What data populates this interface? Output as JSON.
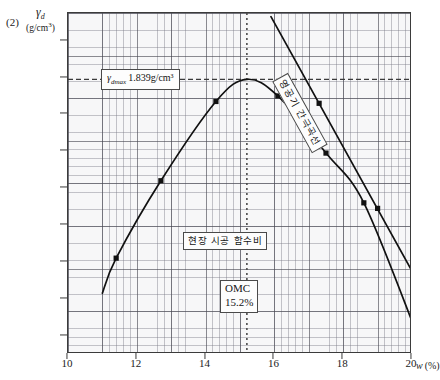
{
  "figure": {
    "number": "(2)",
    "y_axis_symbol": "γd",
    "y_axis_unit": "(g/cm³)",
    "x_axis_label": "w (%)"
  },
  "annotations": {
    "gamma_max": {
      "symbol": "γdmax",
      "equals": "=",
      "value": "1.839g/cm³",
      "full_text": "γdmax =1.839g/cm³"
    },
    "field_water_content": "현장 시공 함수비",
    "omc_title": "OMC",
    "omc_value": "15.2%",
    "zero_air_voids_curve": "영공기 간극곡선"
  },
  "colors": {
    "curve": "#111111",
    "grid_major": "#46464f",
    "grid_minor": "#787884",
    "axis": "#3b3b3b",
    "dotted_guide": "#555555"
  },
  "chart_data": {
    "type": "line",
    "title": "",
    "xlabel": "w (%)",
    "ylabel": "γd (g/cm³)",
    "xlim": [
      10,
      20
    ],
    "ylim": [
      1.69,
      1.875
    ],
    "xticks": [
      10,
      12,
      14,
      16,
      18,
      20
    ],
    "yticks": [
      1.7,
      1.72,
      1.74,
      1.76,
      1.78,
      1.8,
      1.82,
      1.84,
      1.86
    ],
    "grid": true,
    "legend": "none",
    "series": [
      {
        "name": "다짐곡선 (compaction curve)",
        "marker": "square",
        "x": [
          11.0,
          11.4,
          12.7,
          14.3,
          15.2,
          16.1,
          17.5,
          18.6,
          20.1
        ],
        "y": [
          1.723,
          1.742,
          1.784,
          1.827,
          1.839,
          1.83,
          1.799,
          1.772,
          1.703
        ],
        "data_points_marked": [
          {
            "x": 11.4,
            "y": 1.742
          },
          {
            "x": 12.7,
            "y": 1.784
          },
          {
            "x": 14.3,
            "y": 1.827
          },
          {
            "x": 16.1,
            "y": 1.83
          },
          {
            "x": 17.5,
            "y": 1.799
          },
          {
            "x": 18.6,
            "y": 1.772
          }
        ]
      },
      {
        "name": "영공기 간극곡선 (zero air voids curve)",
        "marker": "square",
        "x": [
          15.9,
          20.0
        ],
        "y": [
          1.873,
          1.735
        ],
        "data_points_marked": [
          {
            "x": 17.3,
            "y": 1.826
          },
          {
            "x": 19.0,
            "y": 1.769
          }
        ]
      }
    ],
    "reference_lines": [
      {
        "name": "gamma_d_max",
        "orientation": "horizontal",
        "value": 1.839,
        "style": "dashed"
      },
      {
        "name": "optimum_moisture_content",
        "orientation": "vertical",
        "value": 15.2,
        "style": "dotted"
      }
    ]
  }
}
